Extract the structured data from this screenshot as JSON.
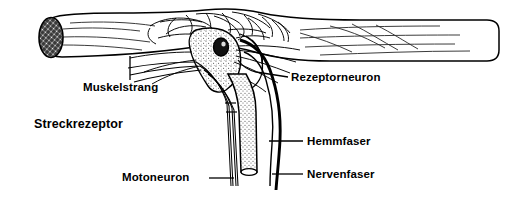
{
  "figure": {
    "title": "Streckrezeptor",
    "background_color": "#ffffff",
    "ink_color": "#000000",
    "labels": {
      "muskelstrang": "Muskelstrang",
      "rezeptorneuron": "Rezeptorneuron",
      "streckrezeptor": "Streckrezeptor",
      "hemmfaser": "Hemmfaser",
      "nervenfaser": "Nervenfaser",
      "motoneuron": "Motoneuron"
    },
    "parts": {
      "muscle_strand": "muscle-strand-shape",
      "cut_face": "cross-hatched-cut-end",
      "receptor_cell": "stippled-receptor-neuron-soma",
      "nucleus": "receptor-cell-nucleus",
      "motor_axon_bundle": "motoneuron-fiber-bundle",
      "inhibitory_fiber": "hemmfaser-thin-fiber",
      "nerve_fiber": "nervenfaser-thick-dark-fiber",
      "nerve_trunk": "stippled-nerve-trunk"
    }
  }
}
